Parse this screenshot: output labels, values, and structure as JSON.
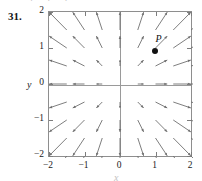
{
  "problem": {
    "number": "31.",
    "top_fragment": "· · ·"
  },
  "chart_data": {
    "type": "scatter",
    "subtype": "vector-field",
    "title": "",
    "xlabel": "x",
    "ylabel": "y",
    "xlim": [
      -2,
      2
    ],
    "ylim": [
      -2,
      2
    ],
    "xticks": [
      "-2",
      "-1",
      "0",
      "1",
      "2"
    ],
    "yticks": [
      "2",
      "1",
      "0",
      "-1",
      "-2"
    ],
    "xtick_values": [
      -2,
      -1,
      0,
      1,
      2
    ],
    "ytick_values": [
      2,
      1,
      0,
      -1,
      -2
    ],
    "grid": false,
    "legend": "none",
    "field_description": "radial vector field pointing away from the origin; arrow length grows with distance from origin",
    "field_formula": "F(x, y) = <x, y>",
    "sample_spacing": 0.5,
    "annotations": [
      {
        "label": "P",
        "x": 1,
        "y": 0.9,
        "marker": "filled-dot"
      }
    ],
    "vectors": [
      {
        "x": -2,
        "y": 2,
        "u": -2,
        "v": 2
      },
      {
        "x": -1.5,
        "y": 2,
        "u": -1.5,
        "v": 2
      },
      {
        "x": -1,
        "y": 2,
        "u": -1,
        "v": 2
      },
      {
        "x": -0.5,
        "y": 2,
        "u": -0.5,
        "v": 2
      },
      {
        "x": 0.5,
        "y": 2,
        "u": 0.5,
        "v": 2
      },
      {
        "x": 1,
        "y": 2,
        "u": 1,
        "v": 2
      },
      {
        "x": 1.5,
        "y": 2,
        "u": 1.5,
        "v": 2
      },
      {
        "x": 2,
        "y": 2,
        "u": 2,
        "v": 2
      },
      {
        "x": -2,
        "y": 1,
        "u": -2,
        "v": 1
      },
      {
        "x": -1,
        "y": 1,
        "u": -1,
        "v": 1
      },
      {
        "x": 1,
        "y": 1,
        "u": 1,
        "v": 1
      },
      {
        "x": 2,
        "y": 1,
        "u": 2,
        "v": 1
      },
      {
        "x": -2,
        "y": -1,
        "u": -2,
        "v": -1
      },
      {
        "x": -1,
        "y": -1,
        "u": -1,
        "v": -1
      },
      {
        "x": 1,
        "y": -1,
        "u": 1,
        "v": -1
      },
      {
        "x": 2,
        "y": -1,
        "u": 2,
        "v": -1
      },
      {
        "x": -2,
        "y": -2,
        "u": -2,
        "v": -2
      },
      {
        "x": -1,
        "y": -2,
        "u": -1,
        "v": -2
      },
      {
        "x": 1,
        "y": -2,
        "u": 1,
        "v": -2
      },
      {
        "x": 2,
        "y": -2,
        "u": 2,
        "v": -2
      }
    ]
  }
}
